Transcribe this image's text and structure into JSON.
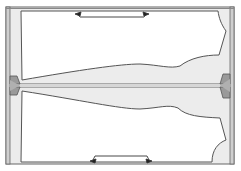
{
  "diagram": {
    "colors": {
      "background": "#ffffff",
      "fabric": "#ebebeb",
      "outline": "#555555",
      "fold_dark": "#9a9a9a",
      "pattern_fill": "#ffffff"
    },
    "pieces": [
      {
        "name": "upper-pattern-piece",
        "grainline": "grainline-arrow-top"
      },
      {
        "name": "lower-pattern-piece",
        "grainline": "grainline-arrow-bottom"
      }
    ],
    "labels": []
  }
}
